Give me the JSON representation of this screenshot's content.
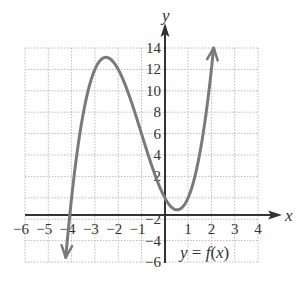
{
  "chart_data": {
    "type": "line",
    "title": "",
    "function_label": "y = f(x)",
    "xlabel": "x",
    "ylabel": "y",
    "xlim": [
      -6,
      4
    ],
    "ylim": [
      -6,
      14
    ],
    "x_ticks": [
      -6,
      -5,
      -4,
      -3,
      -2,
      -1,
      1,
      2,
      3,
      4
    ],
    "x_tick_labels": [
      "−6",
      "−5",
      "−4",
      "−3",
      "−2",
      "−1",
      "1",
      "2",
      "3",
      "4"
    ],
    "y_ticks": [
      -6,
      -4,
      -2,
      2,
      4,
      6,
      8,
      10,
      12,
      14
    ],
    "y_tick_labels": [
      "−6",
      "−4",
      "−2",
      "2",
      "4",
      "6",
      "8",
      "10",
      "12",
      "14"
    ],
    "grid": true,
    "grid_style": "dotted",
    "x_grid_step": 1,
    "y_grid_step": 2,
    "legend": "none",
    "series": [
      {
        "name": "f(x)",
        "description": "cubic curve with x-intercepts at -4, 0, 1; local max near (-2.5, 13.1); local min near (0.5, -1.1); arrows at both ends",
        "x": [
          -4.25,
          -4,
          -3.5,
          -3,
          -2.5,
          -2,
          -1.5,
          -1,
          -0.5,
          0,
          0.5,
          1,
          1.5,
          2,
          2.1
        ],
        "values": [
          -6.0,
          0,
          7.9,
          12,
          13.1,
          12,
          9.4,
          6,
          2.6,
          0,
          -1.1,
          0,
          4.1,
          12,
          14.1
        ]
      }
    ],
    "colors": {
      "curve": "#7a7a7a",
      "axis": "#333333",
      "grid": "#bdbdbd"
    }
  },
  "labels": {
    "x_axis": "x",
    "y_axis": "y",
    "function": {
      "y": "y",
      "eq": " = ",
      "f": "f",
      "open": "(",
      "x": "x",
      "close": ")"
    }
  }
}
